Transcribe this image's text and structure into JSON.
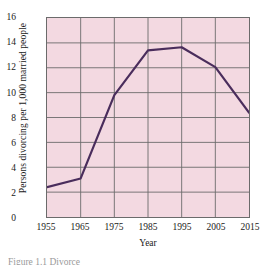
{
  "chart_data": {
    "type": "line",
    "title": "",
    "xlabel": "Year",
    "ylabel": "Persons divorcing per 1,000 married people",
    "x": [
      1955,
      1965,
      1975,
      1985,
      1995,
      2005,
      2015
    ],
    "values": [
      2.4,
      3.1,
      9.8,
      13.4,
      13.65,
      12.05,
      8.4
    ],
    "series": [
      {
        "name": "Persons divorcing per 1,000 married people",
        "values": [
          2.4,
          3.1,
          9.8,
          13.4,
          13.65,
          12.05,
          8.4
        ]
      }
    ],
    "xtick_labels": [
      "1955",
      "1965",
      "1975",
      "1985",
      "1995",
      "2005",
      "2015"
    ],
    "ytick_labels": [
      "0",
      "2",
      "4",
      "6",
      "8",
      "10",
      "12",
      "14",
      "16"
    ],
    "yticks": [
      0,
      2,
      4,
      6,
      8,
      10,
      12,
      14,
      16
    ],
    "xlim": [
      1955,
      2015
    ],
    "ylim": [
      0,
      16
    ],
    "grid": true,
    "legend": "none",
    "line_color": "#4a2d5c",
    "plot_background": "#f3d9e1",
    "grid_color": "#6b6b6b",
    "axis_color": "#6b6b6b"
  },
  "caption": {
    "text": "Figure 1.1 Divorce"
  }
}
